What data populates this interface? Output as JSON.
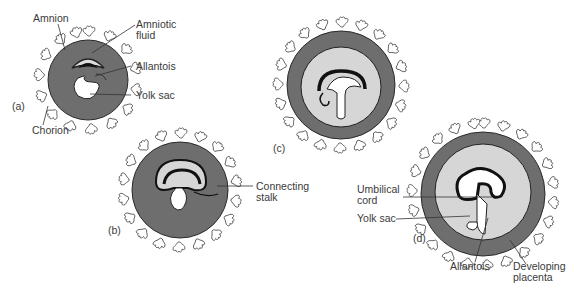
{
  "figure": {
    "stages": [
      {
        "id": "a",
        "label": "(a)",
        "annotations": [
          "Amnion",
          "Amniotic\nfluid",
          "Allantois",
          "Yolk sac",
          "Chorion"
        ]
      },
      {
        "id": "b",
        "label": "(b)",
        "annotations": [
          "Connecting\nstalk"
        ]
      },
      {
        "id": "c",
        "label": "(c)",
        "annotations": []
      },
      {
        "id": "d",
        "label": "(d)",
        "annotations": [
          "Umbilical\ncord",
          "Yolk sac",
          "Allantois",
          "Developing\nplacenta"
        ]
      }
    ]
  },
  "labels": {
    "a_amnion": "Amnion",
    "a_amniotic_fluid": "Amniotic\nfluid",
    "a_allantois": "Allantois",
    "a_yolk_sac": "Yolk sac",
    "a_chorion": "Chorion",
    "a_stage": "(a)",
    "b_connecting_stalk": "Connecting\nstalk",
    "b_stage": "(b)",
    "c_stage": "(c)",
    "d_umbilical_cord": "Umbilical\ncord",
    "d_yolk_sac": "Yolk sac",
    "d_allantois": "Allantois",
    "d_developing_placenta": "Developing\nplacenta",
    "d_stage": "(d)"
  },
  "colors": {
    "chorion_fill": "#6e6e6e",
    "cavity_fill": "#d6d6d6",
    "embryo_dark": "#111111",
    "villi_fill": "#ffffff",
    "outline": "#2a2a2a"
  }
}
